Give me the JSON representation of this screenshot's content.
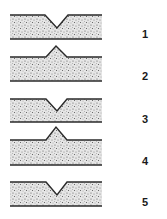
{
  "figure": {
    "colors": {
      "ink": "#2a2a2a",
      "fill": "#d9d9d9",
      "background": "#ffffff"
    },
    "strips": [
      {
        "label": "1",
        "type": "v-notch",
        "direction": "down"
      },
      {
        "label": "2",
        "type": "ridge",
        "direction": "up"
      },
      {
        "label": "3",
        "type": "v-notch",
        "direction": "down"
      },
      {
        "label": "4",
        "type": "ridge",
        "direction": "up"
      },
      {
        "label": "5",
        "type": "v-notch",
        "direction": "down"
      }
    ]
  }
}
